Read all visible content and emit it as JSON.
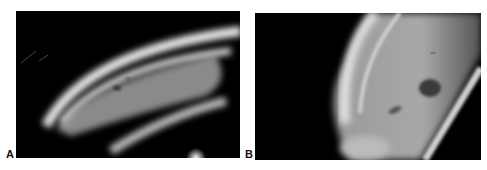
{
  "figure": {
    "panels": [
      {
        "id": "A",
        "label": "A",
        "description": "Slit-lamp view of lens/cornea with bright curved bands and a small dark spot"
      },
      {
        "id": "B",
        "label": "B",
        "description": "Slit-lamp view of curved bright surface with a dark oval lesion and smaller dark mark"
      }
    ],
    "colors": {
      "background": "#ffffff",
      "panel_bg": "#000000",
      "highlight": "#e8e8e8",
      "mid_gray": "#8a8a8a"
    }
  }
}
